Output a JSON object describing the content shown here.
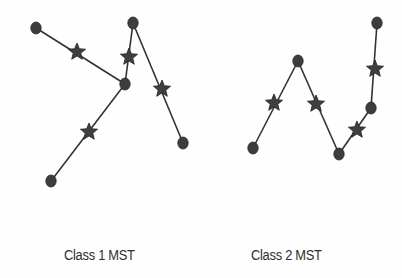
{
  "diagram": {
    "colors": {
      "edge": "#333333",
      "node": "#3d3d3d",
      "node_stroke": "#262626",
      "star": "#3f3f3f",
      "star_stroke": "#222222",
      "label": "#2e2e2e"
    },
    "graphs": [
      {
        "id": "class1",
        "label": "Class 1 MST",
        "label_pos": {
          "x": 64,
          "y": 247
        },
        "nodes": [
          {
            "id": "a",
            "x": 36,
            "y": 28
          },
          {
            "id": "b",
            "x": 125,
            "y": 84
          },
          {
            "id": "c",
            "x": 133,
            "y": 23
          },
          {
            "id": "d",
            "x": 183,
            "y": 143
          },
          {
            "id": "e",
            "x": 51,
            "y": 181
          }
        ],
        "edges": [
          {
            "from": "a",
            "to": "b",
            "star": {
              "x": 77,
              "y": 52
            }
          },
          {
            "from": "b",
            "to": "c",
            "star": {
              "x": 129,
              "y": 57
            }
          },
          {
            "from": "c",
            "to": "d",
            "star": {
              "x": 162,
              "y": 89
            }
          },
          {
            "from": "b",
            "to": "e",
            "star": {
              "x": 89,
              "y": 132
            }
          }
        ]
      },
      {
        "id": "class2",
        "label": "Class 2 MST",
        "label_pos": {
          "x": 251,
          "y": 247
        },
        "nodes": [
          {
            "id": "f",
            "x": 253,
            "y": 148
          },
          {
            "id": "g",
            "x": 298,
            "y": 61
          },
          {
            "id": "h",
            "x": 339,
            "y": 154
          },
          {
            "id": "i",
            "x": 371,
            "y": 108
          },
          {
            "id": "j",
            "x": 377,
            "y": 23
          }
        ],
        "edges": [
          {
            "from": "f",
            "to": "g",
            "star": {
              "x": 274,
              "y": 103
            }
          },
          {
            "from": "g",
            "to": "h",
            "star": {
              "x": 316,
              "y": 104
            }
          },
          {
            "from": "h",
            "to": "i",
            "star": {
              "x": 357,
              "y": 130
            }
          },
          {
            "from": "i",
            "to": "j",
            "star": {
              "x": 375,
              "y": 69
            }
          }
        ]
      }
    ]
  }
}
